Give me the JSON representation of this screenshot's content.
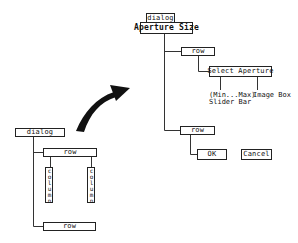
{
  "left_tree": {
    "root": "dialog",
    "row_top": "row",
    "columns": [
      "column",
      "column"
    ],
    "row_bottom": "row"
  },
  "right_tree": {
    "root": "dialog",
    "title": "Aperture Size",
    "row_top": "row",
    "select_aperture": "Select Aperture",
    "leaf_slider_line1": "(Min...Max)",
    "leaf_slider_line2": "Slider Bar",
    "leaf_image": "Image Box",
    "row_bottom": "row",
    "ok": "OK",
    "cancel": "Cancel"
  },
  "arrow": {
    "direction": "left-tree-to-right-tree",
    "color": "#111111"
  }
}
